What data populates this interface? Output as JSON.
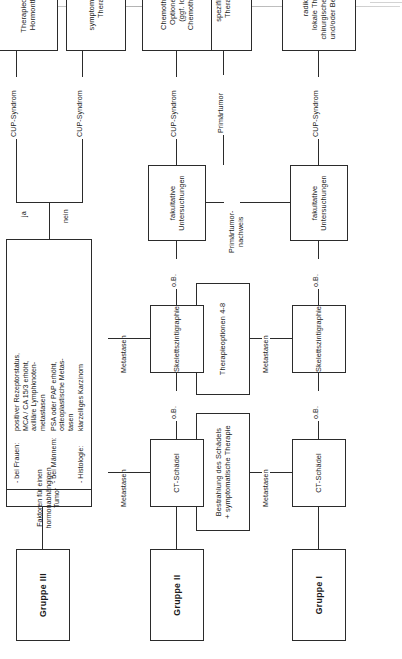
{
  "document": {
    "type": "clinical-decision-flowchart",
    "language": "de",
    "title": "Diagnostik- und Therapiealgorithmus CUP-Syndrom (Gruppe I-III)"
  },
  "groups": {
    "group1": "Gruppe I",
    "group2": "Gruppe II",
    "group3": "Gruppe III"
  },
  "nodes": {
    "ct_schaedel_1": "CT-Schädel",
    "ct_schaedel_2": "CT-Schädel",
    "skelettszintigraphie_1": "Skelettszintigraphie",
    "skelettszintigraphie_2": "Skelettszintigraphie",
    "fakultative_1": "fakultative\nUntersuchungen",
    "fakultative_2": "fakultative\nUntersuchungen",
    "bestrahlung": "Bestrahlung des Schädels\n+ symptomatische Therapie",
    "therapieoptionen_4_8": "Therapieoptionen 4-8",
    "radikale_therapie": "radikale\nlokale Therapie:\nchirurgische Therapie\nund/oder Bestrahlung",
    "spezifische_therapie": "spezifische\nTherapie",
    "chemotherapie": "Chemotherapie:\nOptionen 1-8\n(ggf. lokale\nChemotherapie)",
    "symptomatische_therapie": "symptomatische\nTherapie",
    "hormontherapie": "Therapieoption 8:\nHormontherapie"
  },
  "factor_panel": {
    "header": "Faktoren für einen hormonabhängigen Tumor",
    "rows": [
      {
        "label": "- bei Frauen:",
        "value": "positiver Rezeptorstatus,\nMCA / CA 15/3 erhöht,\naxilläre Lymphknoten-\nmetastasen"
      },
      {
        "label": "- bei Männern:",
        "value": "PSA oder PAP erhöht,\nosteoplastische Metas-\ntasen"
      },
      {
        "label": "- Histologie:",
        "value": "klarzelliges Karzinom"
      }
    ]
  },
  "edge_labels": {
    "ob_1": "o.B.",
    "ob_2": "o.B.",
    "ob_3": "o.B.",
    "ob_4": "o.B.",
    "metastasen_1": "Metastasen",
    "metastasen_2": "Metastasen",
    "metastasen_3": "Metastasen",
    "metastasen_4": "Metastasen",
    "cup_syndrom_1": "CUP-Syndrom",
    "cup_syndrom_2": "CUP-Syndrom",
    "cup_syndrom_3": "CUP-Syndrom",
    "cup_syndrom_4": "CUP-Syndrom",
    "primaertumor_nachweis": "Primärtumor-\nnachweis",
    "primaertumor": "Primärtumor",
    "ja": "ja",
    "nein": "nein"
  },
  "colors": {
    "ink": "#2b2b2b",
    "paper": "#ffffff",
    "rule": "#b9b9b9"
  }
}
